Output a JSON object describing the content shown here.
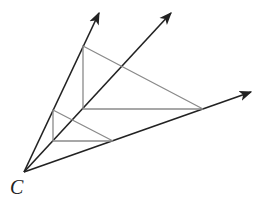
{
  "figure": {
    "vertex_label": "C",
    "vertex": [
      24,
      172
    ],
    "rays": [
      {
        "name": "ray-1",
        "end": [
          99,
          13
        ]
      },
      {
        "name": "ray-2",
        "end": [
          171,
          13
        ]
      },
      {
        "name": "ray-3",
        "end": [
          251,
          92
        ]
      }
    ],
    "large_triangle": {
      "points": [
        [
          83,
          46
        ],
        [
          83,
          109
        ],
        [
          203,
          109
        ]
      ]
    },
    "small_triangle": {
      "points": [
        [
          53,
          110
        ],
        [
          53,
          141
        ],
        [
          113,
          141
        ]
      ]
    },
    "colors": {
      "ray": "#222222",
      "triangle": "#8a8a8a"
    }
  }
}
